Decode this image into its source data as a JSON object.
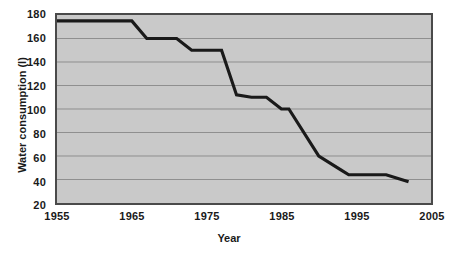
{
  "chart_data": {
    "type": "line",
    "title": "",
    "xlabel": "Year",
    "ylabel": "Water consumption (l)",
    "xlim": [
      1955,
      2005
    ],
    "ylim": [
      20,
      180
    ],
    "xticks": [
      1955,
      1965,
      1975,
      1985,
      1995,
      2005
    ],
    "xtick_labels": [
      "1955",
      "1965",
      "1975",
      "1985",
      "1995",
      "2005"
    ],
    "yticks": [
      20,
      40,
      60,
      80,
      100,
      120,
      140,
      160,
      180
    ],
    "ytick_labels": [
      "20",
      "40",
      "60",
      "80",
      "100",
      "120",
      "140",
      "160",
      "180"
    ],
    "grid": "horizontal",
    "legend": "none",
    "series": [
      {
        "name": "Water consumption",
        "x": [
          1955,
          1965,
          1967,
          1971,
          1973,
          1977,
          1979,
          1981,
          1983,
          1985,
          1986,
          1990,
          1993,
          1994,
          1999,
          2002
        ],
        "values": [
          175,
          175,
          160,
          160,
          150,
          150,
          112,
          110,
          110,
          100,
          100,
          60,
          48,
          44,
          44,
          38
        ]
      }
    ],
    "colors": {
      "line": "#1a1a1a",
      "plot_background": "#c9c9c9",
      "gridline": "#8e8e8e",
      "axis_border": "#4a4a4a",
      "page_background": "#ffffff",
      "text": "#1a1a1a"
    }
  }
}
